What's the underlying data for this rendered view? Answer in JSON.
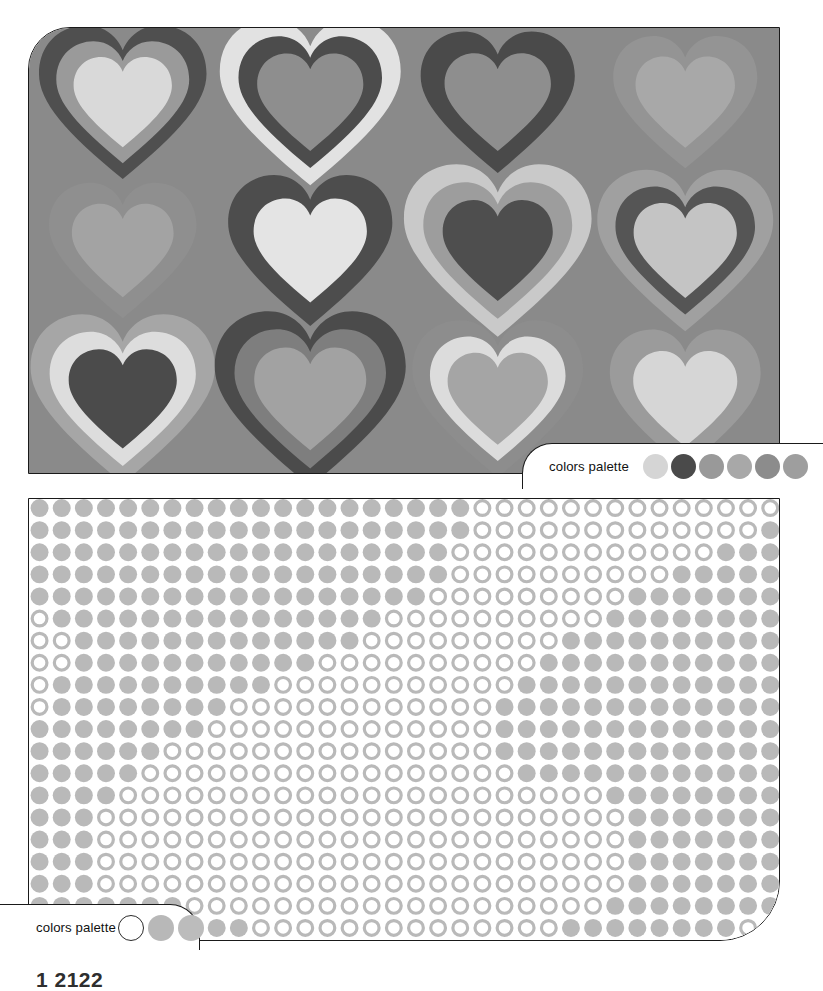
{
  "page": {
    "width": 823,
    "height": 986,
    "background": "#ffffff",
    "footer_caption": "1 2122"
  },
  "panels": [
    {
      "id": "hearts-panel",
      "name": "concentric-hearts-pattern",
      "kind": "pattern-swatch",
      "background": "#8a8a8a",
      "border_color": "#1a1a1a",
      "corner_radius": "42px 0 0 0",
      "grid": {
        "columns": 4,
        "rows": 3
      }
    },
    {
      "id": "dots-panel",
      "name": "dot-grid-pattern",
      "kind": "pattern-swatch",
      "background": "#ffffff",
      "border_color": "#1a1a1a",
      "corner_radius": "0 0 60px 0",
      "grid": {
        "columns": 34,
        "rows": 20
      }
    }
  ],
  "palette_top": {
    "label": "colors palette",
    "swatch_count": 6,
    "swatches": [
      {
        "name": "swatch-light-gray",
        "color": "#d5d5d5",
        "outlined": false
      },
      {
        "name": "swatch-dark-charcoal",
        "color": "#4a4a4a",
        "outlined": false
      },
      {
        "name": "swatch-mid-gray",
        "color": "#999999",
        "outlined": false
      },
      {
        "name": "swatch-warm-gray",
        "color": "#a8a8a8",
        "outlined": false
      },
      {
        "name": "swatch-slate-gray",
        "color": "#8c8c8c",
        "outlined": false
      },
      {
        "name": "swatch-stone-gray",
        "color": "#9e9e9e",
        "outlined": false
      }
    ]
  },
  "palette_bottom": {
    "label": "colors palette",
    "swatch_count": 3,
    "swatches": [
      {
        "name": "swatch-white",
        "color": "#ffffff",
        "outlined": true
      },
      {
        "name": "swatch-light-gray",
        "color": "#b8b8b8",
        "outlined": false
      },
      {
        "name": "swatch-light-gray-2",
        "color": "#bcbcbc",
        "outlined": false
      }
    ]
  },
  "hearts": {
    "background": "#8a8a8a",
    "cell_width": 188,
    "cell_height": 149,
    "items": [
      {
        "row": 0,
        "col": 0,
        "scale": 1.0,
        "rings": [
          "#4f4f4f",
          "#9a9a9a",
          "#d9d9d9"
        ]
      },
      {
        "row": 0,
        "col": 1,
        "scale": 1.08,
        "rings": [
          "#e2e2e2",
          "#4c4c4c",
          "#8e8e8e"
        ]
      },
      {
        "row": 0,
        "col": 2,
        "scale": 0.92,
        "rings": [
          "#4a4a4a",
          "#8e8e8e"
        ]
      },
      {
        "row": 0,
        "col": 3,
        "scale": 0.86,
        "rings": [
          "#949494",
          "#a8a8a8"
        ]
      },
      {
        "row": 1,
        "col": 0,
        "scale": 0.88,
        "rings": [
          "#8f8f8f",
          "#a3a3a3"
        ]
      },
      {
        "row": 1,
        "col": 1,
        "scale": 0.98,
        "rings": [
          "#4d4d4d",
          "#e4e4e4"
        ]
      },
      {
        "row": 1,
        "col": 2,
        "scale": 1.12,
        "rings": [
          "#c9c9c9",
          "#9d9d9d",
          "#4e4e4e"
        ]
      },
      {
        "row": 1,
        "col": 3,
        "scale": 1.05,
        "rings": [
          "#a0a0a0",
          "#555555",
          "#c4c4c4"
        ]
      },
      {
        "row": 2,
        "col": 0,
        "scale": 1.1,
        "rings": [
          "#a6a6a6",
          "#dddddd",
          "#4b4b4b"
        ]
      },
      {
        "row": 2,
        "col": 1,
        "scale": 1.14,
        "rings": [
          "#4b4b4b",
          "#7e7e7e",
          "#a2a2a2"
        ]
      },
      {
        "row": 2,
        "col": 2,
        "scale": 1.02,
        "rings": [
          "#8d8d8d",
          "#dcdcdc",
          "#a5a5a5"
        ]
      },
      {
        "row": 2,
        "col": 3,
        "scale": 0.9,
        "rings": [
          "#9b9b9b",
          "#d6d6d6"
        ]
      }
    ]
  },
  "dots": {
    "fill_color": "#b9b9b9",
    "ring_color": "#b9b9b9",
    "ring_background": "#ffffff",
    "pitch": 22.2,
    "radius": 9.0,
    "ring_stroke": 3.2,
    "columns": 34,
    "rows": 20
  }
}
